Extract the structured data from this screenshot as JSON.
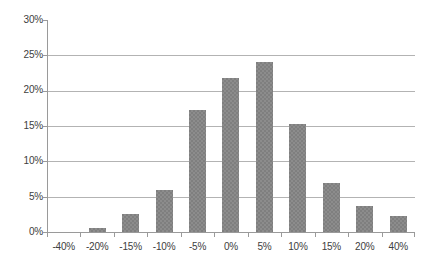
{
  "chart_data": {
    "type": "bar",
    "title": "",
    "subtitle": "",
    "xlabel": "",
    "ylabel": "",
    "categories": [
      "-40%",
      "-20%",
      "-15%",
      "-10%",
      "-5%",
      "0%",
      "5%",
      "10%",
      "15%",
      "20%",
      "40%"
    ],
    "values": [
      0.0,
      0.5,
      2.5,
      5.9,
      17.3,
      21.8,
      24.0,
      15.3,
      7.0,
      3.7,
      2.3
    ],
    "value_unit": "%",
    "ylim": [
      0,
      30
    ],
    "ytick_values": [
      0,
      5,
      10,
      15,
      20,
      25,
      30
    ],
    "ytick_labels": [
      "0%",
      "5%",
      "10%",
      "15%",
      "20%",
      "25%",
      "30%"
    ],
    "grid": true,
    "grid_axis": "y",
    "legend": false,
    "legend_position": "none",
    "series": [
      {
        "name": "Frequency",
        "values": [
          0.0,
          0.5,
          2.5,
          5.9,
          17.3,
          21.8,
          24.0,
          15.3,
          7.0,
          3.7,
          2.3
        ]
      }
    ]
  },
  "colors": {
    "bar_fill": "#7f7f7f",
    "gridline": "#b3b3b3",
    "axis": "#9a9a9a",
    "tick_text": "#404040",
    "background": "#ffffff"
  }
}
